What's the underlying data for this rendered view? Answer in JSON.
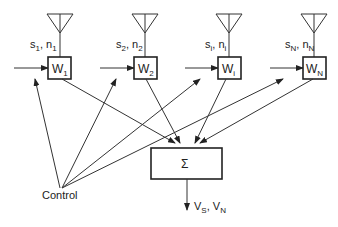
{
  "diagram": {
    "title": "",
    "elements": [
      {
        "id": "W1",
        "label": "W",
        "sub": "1",
        "signal": "s",
        "signal_sub": "1",
        "noise": "n",
        "noise_sub": "1"
      },
      {
        "id": "W2",
        "label": "W",
        "sub": "2",
        "signal": "s",
        "signal_sub": "2",
        "noise": "n",
        "noise_sub": "2"
      },
      {
        "id": "Wi",
        "label": "W",
        "sub": "i",
        "signal": "s",
        "signal_sub": "i",
        "noise": "n",
        "noise_sub": "i"
      },
      {
        "id": "WN",
        "label": "W",
        "sub": "N",
        "signal": "s",
        "signal_sub": "N",
        "noise": "n",
        "noise_sub": "N"
      }
    ],
    "summer": {
      "symbol": "Σ"
    },
    "control": {
      "label": "Control"
    },
    "output": {
      "v1": "V",
      "v1_sub": "S",
      "v2": "V",
      "v2_sub": "N"
    }
  }
}
